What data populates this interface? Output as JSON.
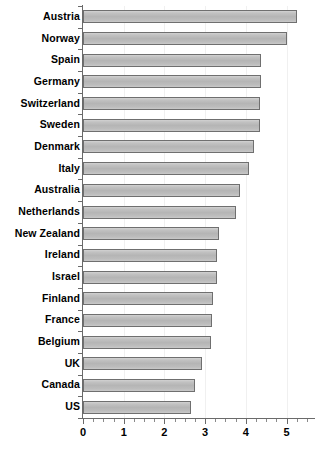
{
  "chart_data": {
    "type": "bar",
    "orientation": "horizontal",
    "title": "",
    "xlabel": "",
    "ylabel": "",
    "xlim": [
      0,
      5.7
    ],
    "grid": true,
    "legend": "none",
    "xticks": [
      "0",
      "1",
      "2",
      "3",
      "4",
      "5"
    ],
    "xtick_values": [
      0,
      1,
      2,
      3,
      4,
      5
    ],
    "categories": [
      "Austria",
      "Norway",
      "Spain",
      "Germany",
      "Switzerland",
      "Sweden",
      "Denmark",
      "Italy",
      "Australia",
      "Netherlands",
      "New Zealand",
      "Ireland",
      "Israel",
      "Finland",
      "France",
      "Belgium",
      "UK",
      "Canada",
      "US"
    ],
    "values": [
      5.27,
      5.0,
      4.38,
      4.37,
      4.36,
      4.34,
      4.2,
      4.07,
      3.85,
      3.76,
      3.33,
      3.3,
      3.28,
      3.2,
      3.17,
      3.15,
      2.92,
      2.75,
      2.65
    ],
    "series": [
      {
        "name": "value",
        "values": [
          5.27,
          5.0,
          4.38,
          4.37,
          4.36,
          4.34,
          4.2,
          4.07,
          3.85,
          3.76,
          3.33,
          3.3,
          3.28,
          3.2,
          3.17,
          3.15,
          2.92,
          2.75,
          2.65
        ]
      }
    ],
    "colors": {
      "bar_fill": "#b9b9b9",
      "bar_edge": "#6f6f6f",
      "axis": "#6a6a6a",
      "grid": "#f0f0f0",
      "text": "#000000",
      "background": "#ffffff"
    }
  }
}
